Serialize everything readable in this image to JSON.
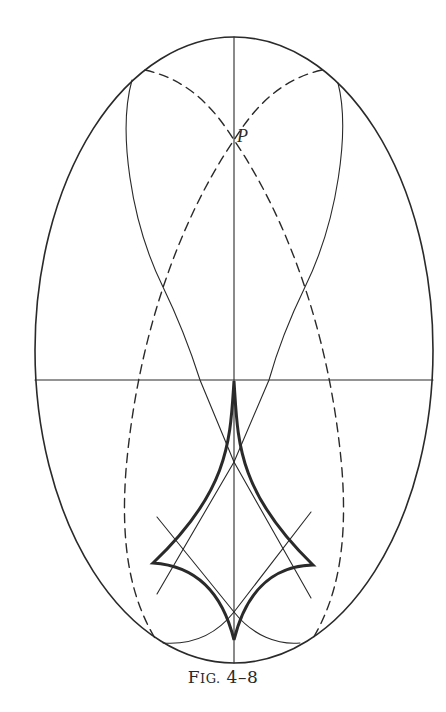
{
  "figure": {
    "caption_prefix": "F",
    "caption_smallcaps": "IG.",
    "caption_number": " 4–8",
    "point_label": "P"
  },
  "colors": {
    "ink": "#2a2a2a",
    "background": "#ffffff"
  },
  "geometry": {
    "outer_ellipse": {
      "cx": 234,
      "cy": 350,
      "rx": 199,
      "ry": 313
    },
    "horizontal_axis_y": 380,
    "vertical_axis_x": 234,
    "point_P": [
      234,
      140
    ],
    "astroid_cusps": {
      "top": [
        234,
        381
      ],
      "left": [
        153,
        563
      ],
      "right": [
        313,
        565
      ],
      "bottom": [
        234,
        640
      ]
    }
  }
}
